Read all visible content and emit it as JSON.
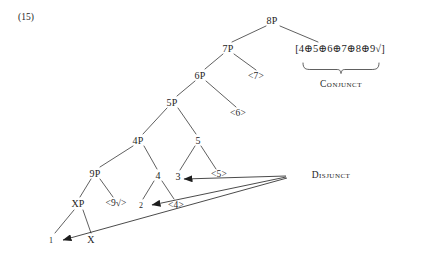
{
  "example": {
    "number": "(15)"
  },
  "tree": {
    "nodes": {
      "root": "8P",
      "n7p": "7P",
      "n6p": "6P",
      "n5p": "5P",
      "n4p": "4P",
      "n9p": "9P",
      "nxp": "XP",
      "n5": "5",
      "n4": "4",
      "n3": "3",
      "n2": "2",
      "n1": "1",
      "nx": "X",
      "a7": "<7>",
      "a6": "<6>",
      "a5": "<5>",
      "a4": "<4>",
      "a9": "<9√>"
    },
    "formula": "[4⊕5⊕6⊕7⊕8⊕9√]"
  },
  "annotations": {
    "conjunct": "Conjunct",
    "disjunct": "Disjunct"
  },
  "colors": {
    "ink": "#1d1d1d",
    "line": "#262626",
    "background": "#ffffff"
  }
}
